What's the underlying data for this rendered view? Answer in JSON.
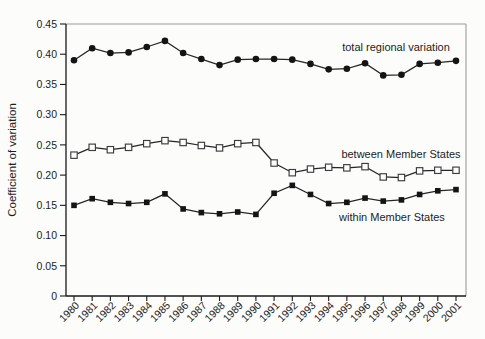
{
  "chart_data": {
    "type": "line",
    "title": "",
    "xlabel": "",
    "ylabel": "Coefficient of variation",
    "x": [
      "1980",
      "1981",
      "1982",
      "1983",
      "1984",
      "1985",
      "1986",
      "1987",
      "1988",
      "1989",
      "1990",
      "1991",
      "1992",
      "1993",
      "1994",
      "1995",
      "1996",
      "1997",
      "1998",
      "1999",
      "2000",
      "2001"
    ],
    "ylim": [
      0,
      0.45
    ],
    "ytick_step": 0.05,
    "ytick_labels": [
      "0",
      "0.05",
      "0.10",
      "0.15",
      "0.20",
      "0.25",
      "0.30",
      "0.35",
      "0.40",
      "0.45"
    ],
    "grid": false,
    "legend_position": "inline-labels-right",
    "series": [
      {
        "name": "total regional variation",
        "marker": "filled-circle",
        "values": [
          0.39,
          0.41,
          0.402,
          0.403,
          0.412,
          0.422,
          0.402,
          0.392,
          0.382,
          0.391,
          0.392,
          0.392,
          0.391,
          0.384,
          0.375,
          0.376,
          0.385,
          0.365,
          0.366,
          0.384,
          0.386,
          0.389
        ]
      },
      {
        "name": "between Member States",
        "marker": "open-square",
        "values": [
          0.233,
          0.246,
          0.242,
          0.246,
          0.252,
          0.257,
          0.254,
          0.249,
          0.245,
          0.252,
          0.254,
          0.22,
          0.204,
          0.21,
          0.213,
          0.212,
          0.214,
          0.197,
          0.196,
          0.207,
          0.208,
          0.208
        ]
      },
      {
        "name": "within Member States",
        "marker": "filled-square",
        "values": [
          0.15,
          0.161,
          0.155,
          0.153,
          0.155,
          0.169,
          0.144,
          0.138,
          0.136,
          0.139,
          0.135,
          0.17,
          0.183,
          0.168,
          0.153,
          0.155,
          0.162,
          0.157,
          0.159,
          0.168,
          0.174,
          0.176
        ]
      }
    ],
    "annotations": [
      {
        "text": "total regional variation",
        "near_year": "1998",
        "near_value": 0.412
      },
      {
        "text": "between Member States",
        "near_year": "1998",
        "near_value": 0.235
      },
      {
        "text": "within Member States",
        "near_year": "1997",
        "near_value": 0.131
      }
    ],
    "colors": {
      "line": "#262626",
      "marker_fill": "#141414",
      "open_marker_fill": "#ffffff",
      "open_marker_stroke": "#3c3c3c",
      "axis": "#1a1a1a",
      "frame": "#9c9c9c",
      "text": "#1d1d1d"
    }
  }
}
